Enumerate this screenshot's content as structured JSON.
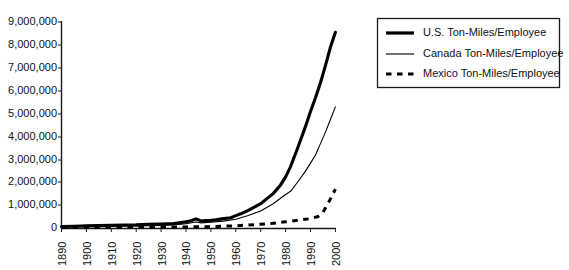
{
  "chart_data": {
    "type": "line",
    "title": "",
    "subtitle": "",
    "xlabel": "",
    "ylabel": "",
    "xlim": [
      1890,
      2000
    ],
    "ylim": [
      0,
      9000000
    ],
    "grid": false,
    "legend_position": "right-top",
    "x_ticks": [
      "1890",
      "1900",
      "1910",
      "1920",
      "1930",
      "1940",
      "1950",
      "1960",
      "1970",
      "1980",
      "1990",
      "2000"
    ],
    "x_tick_values": [
      1890,
      1900,
      1910,
      1920,
      1930,
      1940,
      1950,
      1960,
      1970,
      1980,
      1990,
      2000
    ],
    "y_ticks": [
      "0",
      "1,000,000",
      "2,000,000",
      "3,000,000",
      "4,000,000",
      "5,000,000",
      "6,000,000",
      "7,000,000",
      "8,000,000",
      "9,000,000"
    ],
    "y_tick_values": [
      0,
      1000000,
      2000000,
      3000000,
      4000000,
      5000000,
      6000000,
      7000000,
      8000000,
      9000000
    ],
    "series": [
      {
        "name": "U.S. Ton-Miles/Employee",
        "style": "thick-solid",
        "color": "#000000",
        "x": [
          1890,
          1895,
          1900,
          1905,
          1910,
          1915,
          1920,
          1925,
          1930,
          1935,
          1940,
          1942,
          1944,
          1946,
          1948,
          1950,
          1952,
          1955,
          1958,
          1960,
          1962,
          1965,
          1968,
          1970,
          1972,
          1975,
          1978,
          1980,
          1982,
          1985,
          1988,
          1990,
          1992,
          1994,
          1996,
          1998,
          2000
        ],
        "values": [
          90000,
          100000,
          115000,
          125000,
          135000,
          150000,
          160000,
          185000,
          195000,
          215000,
          290000,
          340000,
          420000,
          330000,
          345000,
          355000,
          375000,
          430000,
          470000,
          560000,
          640000,
          790000,
          960000,
          1080000,
          1260000,
          1520000,
          1900000,
          2250000,
          2700000,
          3550000,
          4450000,
          5100000,
          5700000,
          6350000,
          7100000,
          7900000,
          8550000
        ]
      },
      {
        "name": "Canada Ton-Miles/Employee",
        "style": "thin-solid",
        "color": "#000000",
        "x": [
          1890,
          1900,
          1910,
          1920,
          1930,
          1935,
          1940,
          1944,
          1946,
          1950,
          1955,
          1960,
          1965,
          1970,
          1975,
          1980,
          1982,
          1985,
          1988,
          1990,
          1992,
          1994,
          1996,
          1998,
          2000
        ],
        "values": [
          70000,
          85000,
          100000,
          110000,
          130000,
          150000,
          210000,
          280000,
          245000,
          270000,
          320000,
          400000,
          570000,
          760000,
          1080000,
          1480000,
          1620000,
          2050000,
          2500000,
          2850000,
          3200000,
          3700000,
          4200000,
          4750000,
          5300000
        ]
      },
      {
        "name": "Mexico Ton-Miles/Employee",
        "style": "dashed",
        "color": "#000000",
        "x": [
          1890,
          1910,
          1930,
          1940,
          1950,
          1955,
          1960,
          1965,
          1970,
          1975,
          1980,
          1985,
          1990,
          1993,
          1995,
          1997,
          1999,
          2000
        ],
        "values": [
          40000,
          50000,
          60000,
          70000,
          85000,
          100000,
          120000,
          150000,
          185000,
          230000,
          290000,
          360000,
          430000,
          520000,
          700000,
          1080000,
          1500000,
          1720000
        ]
      }
    ]
  },
  "legend": {
    "entries": [
      {
        "label": "U.S. Ton-Miles/Employee",
        "style": "thick-solid"
      },
      {
        "label": "Canada Ton-Miles/Employee",
        "style": "thin-solid"
      },
      {
        "label": "Mexico Ton-Miles/Employee",
        "style": "dashed"
      }
    ]
  },
  "axes": {
    "y_labels": [
      "9,000,000",
      "8,000,000",
      "7,000,000",
      "6,000,000",
      "5,000,000",
      "4,000,000",
      "3,000,000",
      "2,000,000",
      "1,000,000",
      "0"
    ],
    "x_labels": [
      "1890",
      "1900",
      "1910",
      "1920",
      "1930",
      "1940",
      "1950",
      "1960",
      "1970",
      "1980",
      "1990",
      "2000"
    ]
  }
}
